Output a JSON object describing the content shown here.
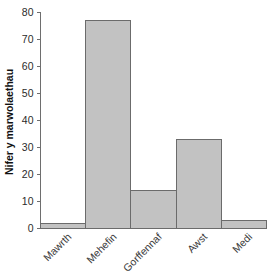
{
  "chart_data": {
    "type": "bar",
    "title": "",
    "subtitle": "",
    "xlabel": "",
    "ylabel": "Nifer y marwolaethau",
    "categories": [
      "Mawrth",
      "Mehefin",
      "Gorffennaf",
      "Awst",
      "Medi"
    ],
    "values": [
      2,
      77,
      14,
      33,
      3
    ],
    "series": [
      {
        "name": "Nifer y marwolaethau",
        "values": [
          2,
          77,
          14,
          33,
          3
        ]
      }
    ],
    "ylim": [
      0,
      80
    ],
    "ytick_labels": [
      "0",
      "10",
      "20",
      "30",
      "40",
      "50",
      "60",
      "70",
      "80"
    ],
    "ytick_values": [
      0,
      10,
      20,
      30,
      40,
      50,
      60,
      70,
      80
    ],
    "grid": false,
    "legend": false,
    "legend_position": "none",
    "bars_touching": true,
    "xtick_label_rotation": 45,
    "colors": {
      "bar_fill": "#c2c2c2",
      "bar_stroke": "#6b6b6b",
      "axis": "#6e6e6e",
      "tick_text": "#2b2b2b",
      "category_text": "#3a3a3a",
      "axis_title_text": "#111111",
      "background": "#ffffff"
    }
  }
}
